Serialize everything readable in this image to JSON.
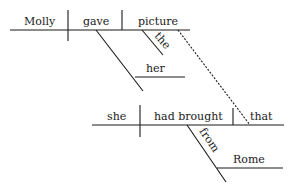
{
  "diagram": {
    "type": "sentence-diagram (Reed-Kellogg)",
    "main_clause": {
      "subject": "Molly",
      "verb": "gave",
      "direct_object": "picture",
      "object_modifier": "the",
      "indirect_object": "her"
    },
    "relative_clause": {
      "subject": "she",
      "verb": "had brought",
      "object": "that",
      "preposition": "from",
      "prepositional_object": "Rome"
    },
    "colors": {
      "line": "#1a1a1a",
      "background": "#ffffff"
    }
  }
}
